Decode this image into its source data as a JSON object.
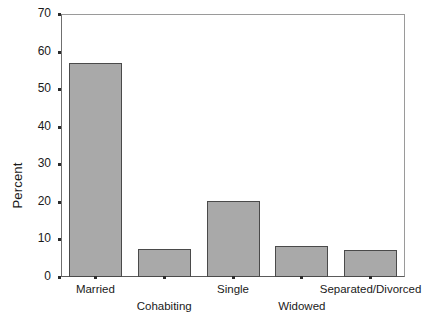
{
  "chart_data": {
    "type": "bar",
    "title": "",
    "subtitle": "",
    "xlabel": "",
    "ylabel": "Percent",
    "categories": [
      "Married",
      "Cohabiting",
      "Single",
      "Widowed",
      "Separated/Divorced"
    ],
    "values": [
      57.0,
      7.5,
      20.3,
      8.2,
      7.1
    ],
    "ylim": [
      0,
      70
    ],
    "yticks": [
      0,
      10,
      20,
      30,
      40,
      50,
      60,
      70
    ],
    "ytick_labels": [
      "0",
      "10",
      "20",
      "30",
      "40",
      "50",
      "60",
      "70"
    ],
    "grid": false,
    "legend": null,
    "legend_position": "none",
    "annotations": [],
    "bar_fill_color": "#a9a9a9",
    "bar_edge_color": "#4a4a4a",
    "axis_color": "#5a5a5a",
    "background_color": "#ffffff",
    "xlabel_stagger": [
      "row1",
      "row2",
      "row1",
      "row2",
      "row1"
    ]
  }
}
